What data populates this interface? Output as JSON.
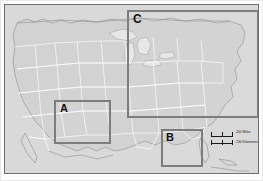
{
  "figure": {
    "type": "locator-map",
    "background_color": "#d9d9d9",
    "frame_color": "#6f6f6f",
    "state_line_color": "#ffffff",
    "locator_box_color": "#7d7d7d"
  },
  "locator_boxes": [
    {
      "label": "A",
      "region": "Four Corners / Arizona - New Mexico",
      "x": 49,
      "y": 95,
      "width": 57,
      "height": 44
    },
    {
      "label": "B",
      "region": "Gulf Coast / Florida panhandle",
      "x": 156,
      "y": 124,
      "width": 42,
      "height": 38
    },
    {
      "label": "C",
      "region": "Great Lakes / Northeastern United States",
      "x": 122,
      "y": 5,
      "width": 132,
      "height": 108
    }
  ],
  "scale_bar": {
    "miles_label": "200 Miles",
    "kilometers_label": "200 Kilometers",
    "miles_value": 200,
    "kilometers_value": 200,
    "divisions": 2
  }
}
